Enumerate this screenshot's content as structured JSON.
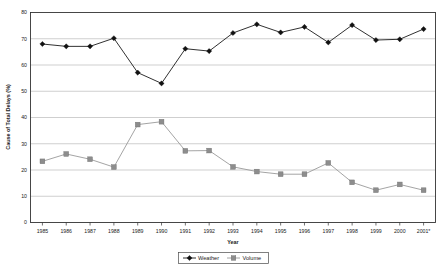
{
  "chart_data": {
    "type": "line",
    "title": "",
    "xlabel": "Year",
    "ylabel": "Cause of Total Delays (%)",
    "categories": [
      "1985",
      "1986",
      "1987",
      "1988",
      "1989",
      "1990",
      "1991",
      "1992",
      "1993",
      "1994",
      "1995",
      "1996",
      "1997",
      "1998",
      "1999",
      "2000",
      "2001*"
    ],
    "x": [
      1985,
      1986,
      1987,
      1988,
      1989,
      1990,
      1991,
      1992,
      1993,
      1994,
      1995,
      1996,
      1997,
      1998,
      1999,
      2000,
      2001
    ],
    "series": [
      {
        "name": "Weather",
        "marker": "diamond",
        "color": "#111111",
        "values": [
          68.0,
          67.1,
          67.1,
          70.2,
          57.1,
          53.0,
          66.2,
          65.3,
          72.2,
          75.5,
          72.4,
          74.5,
          68.6,
          75.2,
          69.5,
          69.8,
          73.7
        ]
      },
      {
        "name": "Volume",
        "marker": "square",
        "color": "#8d8d8d",
        "values": [
          23.3,
          26.1,
          24.1,
          21.1,
          37.3,
          38.4,
          27.3,
          27.4,
          21.2,
          19.4,
          18.4,
          18.4,
          22.7,
          15.3,
          12.3,
          14.5,
          12.3
        ]
      }
    ],
    "ylim": [
      0,
      80
    ],
    "yticks": [
      0,
      10,
      20,
      30,
      40,
      50,
      60,
      70,
      80
    ],
    "ytick_labels": [
      "0",
      "10",
      "20",
      "30",
      "40",
      "50",
      "60",
      "70",
      "80"
    ],
    "grid": true,
    "grid_axis": "y",
    "legend_position": "bottom",
    "footnote": ""
  },
  "axes": {
    "y_title": "Cause of Total Delays (%)",
    "x_title": "Year"
  },
  "legend": {
    "items": [
      {
        "label": "Weather"
      },
      {
        "label": "Volume"
      }
    ]
  }
}
